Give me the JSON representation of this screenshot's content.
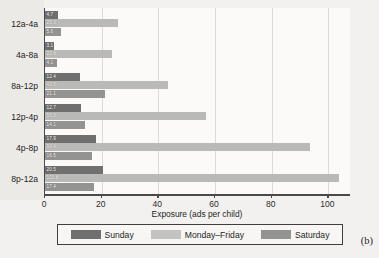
{
  "panel_label": "(b)",
  "legend": {
    "position": "bottom",
    "items": [
      {
        "label": "Sunday",
        "color": "#6f6f6f",
        "key": "sunday"
      },
      {
        "label": "Monday–Friday",
        "color": "#c3c3c1",
        "key": "weekday"
      },
      {
        "label": "Saturday",
        "color": "#939392",
        "key": "saturday"
      }
    ]
  },
  "axis": {
    "x_title": "Exposure (ads per child)",
    "x_ticks": [
      "0",
      "20",
      "40",
      "60",
      "80",
      "100"
    ]
  },
  "chart_data": {
    "type": "bar",
    "orientation": "horizontal",
    "title": "",
    "subtitle": "",
    "xlabel": "Exposure (ads per child)",
    "ylabel": "",
    "xlim": [
      0,
      108
    ],
    "grid": true,
    "grid_axis": "x",
    "legend_position": "bottom",
    "categories": [
      "12a-4a",
      "4a-8a",
      "8a-12p",
      "12p-4p",
      "4p-8p",
      "8p-12a"
    ],
    "series": [
      {
        "name": "Sunday",
        "color": "#6f6f6f",
        "values": [
          4.7,
          3.1,
          12.4,
          12.7,
          17.9,
          20.5
        ]
      },
      {
        "name": "Monday–Friday",
        "color": "#b9b9b7",
        "values": [
          25.9,
          23.8,
          43.5,
          56.8,
          93.4,
          103.8
        ]
      },
      {
        "name": "Saturday",
        "color": "#939392",
        "values": [
          5.6,
          4.1,
          21.1,
          14.1,
          16.5,
          17.4
        ]
      }
    ],
    "bar_labels": [
      [
        "4.7",
        "25.9",
        "5.6"
      ],
      [
        "3.1",
        "23.8",
        "4.1"
      ],
      [
        "12.4",
        "43.5",
        "21.1"
      ],
      [
        "12.7",
        "56.8",
        "14.1"
      ],
      [
        "17.9",
        "93.4",
        "16.5"
      ],
      [
        "20.5",
        "103.8",
        "17.4"
      ]
    ]
  }
}
